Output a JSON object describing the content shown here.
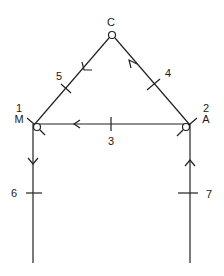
{
  "diagram": {
    "type": "flow-graph",
    "nodes": [
      {
        "id": "C",
        "name": "C",
        "number": ""
      },
      {
        "id": "M",
        "name": "M",
        "number": "1"
      },
      {
        "id": "A",
        "name": "A",
        "number": "2"
      }
    ],
    "edges": [
      {
        "label": "3",
        "from": "A",
        "to": "M",
        "direction": "left"
      },
      {
        "label": "4",
        "from": "A",
        "to": "C",
        "direction": "up-left"
      },
      {
        "label": "5",
        "from": "C",
        "to": "M",
        "direction": "down-left"
      },
      {
        "label": "6",
        "from": "M",
        "to": "bottom",
        "direction": "down"
      },
      {
        "label": "7",
        "from": "bottom",
        "to": "A",
        "direction": "up"
      }
    ]
  }
}
